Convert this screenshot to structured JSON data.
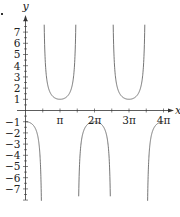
{
  "chart_data": {
    "type": "line",
    "title": "",
    "function": "y = -sec(x)",
    "xlabel": "x",
    "ylabel": "y",
    "xlim": [
      -0.1,
      4.15
    ],
    "xlim_units": "pi",
    "ylim": [
      -8.2,
      8.5
    ],
    "x_ticks": [
      {
        "value_pi": 1,
        "label": "π"
      },
      {
        "value_pi": 2,
        "label": "2π"
      },
      {
        "value_pi": 3,
        "label": "3π"
      },
      {
        "value_pi": 4,
        "label": "4π"
      }
    ],
    "x_minor_ticks_pi": [
      0.5,
      1.5,
      2.5,
      3.5
    ],
    "y_ticks": [
      {
        "value": 7,
        "label": "7"
      },
      {
        "value": 6,
        "label": "6"
      },
      {
        "value": 5,
        "label": "5"
      },
      {
        "value": 4,
        "label": "4"
      },
      {
        "value": 3,
        "label": "3"
      },
      {
        "value": 2,
        "label": "2"
      },
      {
        "value": 1,
        "label": "1"
      },
      {
        "value": -1,
        "label": "−1"
      },
      {
        "value": -2,
        "label": "−2"
      },
      {
        "value": -3,
        "label": "−3"
      },
      {
        "value": -4,
        "label": "−4"
      },
      {
        "value": -5,
        "label": "−5"
      },
      {
        "value": -6,
        "label": "−6"
      },
      {
        "value": -7,
        "label": "−7"
      }
    ],
    "branches": [
      {
        "x_from_pi": 0,
        "x_to_pi": 0.5,
        "direction": "down",
        "extremum": {
          "x_pi": 0,
          "y": -1
        }
      },
      {
        "x_from_pi": 0.5,
        "x_to_pi": 1.5,
        "direction": "up",
        "extremum": {
          "x_pi": 1,
          "y": 1
        }
      },
      {
        "x_from_pi": 1.5,
        "x_to_pi": 2.5,
        "direction": "down",
        "extremum": {
          "x_pi": 2,
          "y": -1
        }
      },
      {
        "x_from_pi": 2.5,
        "x_to_pi": 3.5,
        "direction": "up",
        "extremum": {
          "x_pi": 3,
          "y": 1
        }
      },
      {
        "x_from_pi": 3.5,
        "x_to_pi": 4,
        "direction": "down",
        "extremum": {
          "x_pi": 4,
          "y": -1
        }
      }
    ],
    "grid": false,
    "legend": null
  },
  "colors": {
    "axis": "#333333",
    "curve": "#666666",
    "text": "#222222"
  }
}
